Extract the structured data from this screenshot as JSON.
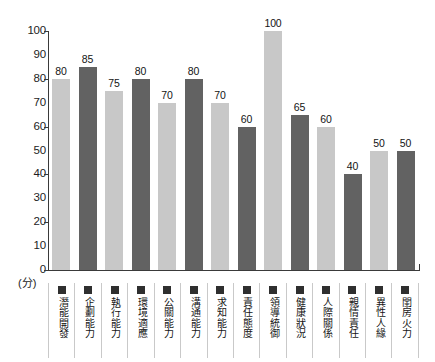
{
  "chart_data": {
    "type": "bar",
    "title": "",
    "subtitle": "",
    "xlabel": "",
    "ylabel": "(分)",
    "unit_label": "(分)",
    "ylim": [
      0,
      100
    ],
    "y_ticks": [
      100,
      90,
      80,
      70,
      60,
      50,
      40,
      30,
      20,
      10,
      0
    ],
    "y_tick_labels": [
      "100",
      "90",
      "80",
      "70",
      "60",
      "50",
      "40",
      "30",
      "20",
      "10",
      "0"
    ],
    "y_major_ticks": [
      100,
      80,
      60,
      40,
      20,
      0
    ],
    "grid": false,
    "legend": "none",
    "categories": [
      "潛能開發",
      "企劃能力",
      "執行能力",
      "環境適應",
      "公關能力",
      "溝通能力",
      "求知能力",
      "責任態度",
      "領導統御",
      "健康狀況",
      "人際關係",
      "親情責任",
      "異性人緣",
      "閨房火力"
    ],
    "values": [
      80,
      85,
      75,
      80,
      70,
      80,
      70,
      60,
      100,
      65,
      60,
      40,
      50,
      50
    ],
    "value_labels": [
      "80",
      "85",
      "75",
      "80",
      "70",
      "80",
      "70",
      "60",
      "100",
      "65",
      "60",
      "40",
      "50",
      "50"
    ],
    "bar_colors": [
      "#c8c8c8",
      "#626262",
      "#c8c8c8",
      "#626262",
      "#c8c8c8",
      "#626262",
      "#c8c8c8",
      "#626262",
      "#c8c8c8",
      "#626262",
      "#c8c8c8",
      "#626262",
      "#c8c8c8",
      "#626262"
    ],
    "palette": {
      "light_bar": "#c8c8c8",
      "dark_bar": "#626262",
      "axis": "#3a3a3a",
      "text": "#151515",
      "cell_border": "#c9c9c9",
      "legend_swatch": "#2f2f2f",
      "background": "#ffffff"
    }
  }
}
